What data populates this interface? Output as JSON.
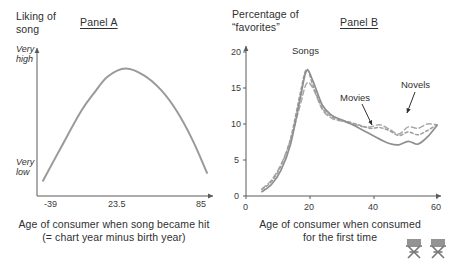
{
  "figure": {
    "background": "#ffffff",
    "curve_color": "#9a9a9a",
    "axis_color": "#5a5a5a",
    "text_color": "#2f2f2f"
  },
  "panel_a": {
    "title": "Panel A",
    "y_axis_title": "Liking of\nsong",
    "y_axis_max_label": "Very\nhigh",
    "y_axis_min_label": "Very\nlow",
    "x_ticks": [
      "-39",
      "23.5",
      "85"
    ],
    "caption": "Age of consumer when song became hit\n(= chart year minus birth year)"
  },
  "panel_b": {
    "title": "Panel B",
    "y_axis_title": "Percentage of\n“favorites”",
    "y_ticks": [
      "0",
      "5",
      "10",
      "15",
      "20"
    ],
    "x_ticks": [
      "0",
      "20",
      "40",
      "60"
    ],
    "caption": "Age of consumer when consumed\nfor the first time",
    "series_labels": {
      "songs": "Songs",
      "movies": "Movies",
      "novels": "Novels"
    },
    "watermark_icon": "director-chair-icon"
  },
  "chart_data": [
    {
      "type": "line",
      "title": "Panel A",
      "xlabel": "Age of consumer when song became hit (= chart year minus birth year)",
      "ylabel": "Liking of song",
      "xlim": [
        -39,
        85
      ],
      "ylim": [
        0,
        1
      ],
      "grid": false,
      "legend": "none",
      "xticks": [
        -39,
        23.5,
        85
      ],
      "yticks_labels": [
        "Very low",
        "Very high"
      ],
      "series": [
        {
          "name": "Liking of song",
          "style": "solid",
          "x": [
            -39,
            -25,
            -10,
            0,
            10,
            23.5,
            37,
            50,
            62,
            74,
            85
          ],
          "y": [
            0.07,
            0.33,
            0.6,
            0.74,
            0.86,
            0.92,
            0.87,
            0.76,
            0.6,
            0.38,
            0.13
          ]
        }
      ]
    },
    {
      "type": "line",
      "title": "Panel B",
      "xlabel": "Age of consumer when consumed for the first time",
      "ylabel": "Percentage of “favorites”",
      "xlim": [
        0,
        60
      ],
      "ylim": [
        0,
        20
      ],
      "grid": false,
      "legend": "annotations",
      "xticks": [
        0,
        20,
        40,
        60
      ],
      "yticks": [
        0,
        5,
        10,
        15,
        20
      ],
      "series": [
        {
          "name": "Songs",
          "style": "solid",
          "x": [
            5,
            8,
            11,
            14,
            17,
            19,
            21,
            24,
            27,
            30,
            33,
            36,
            39,
            42,
            45,
            48,
            51,
            54,
            57,
            60
          ],
          "y": [
            0.6,
            1.6,
            3.6,
            7.2,
            13.5,
            17.4,
            16.0,
            12.6,
            11.2,
            10.6,
            10.0,
            9.3,
            8.6,
            7.9,
            7.3,
            7.1,
            7.6,
            7.2,
            8.2,
            9.8
          ]
        },
        {
          "name": "Movies",
          "style": "dashed",
          "x": [
            5,
            8,
            11,
            14,
            17,
            19,
            21,
            24,
            27,
            30,
            33,
            36,
            39,
            42,
            45,
            48,
            51,
            54,
            57,
            60
          ],
          "y": [
            0.9,
            2.0,
            4.2,
            8.0,
            14.2,
            17.6,
            15.4,
            12.2,
            11.0,
            10.5,
            10.2,
            9.8,
            9.4,
            9.5,
            9.1,
            8.4,
            8.9,
            8.5,
            9.1,
            9.9
          ]
        },
        {
          "name": "Novels",
          "style": "dashed",
          "x": [
            5,
            8,
            11,
            14,
            17,
            19,
            21,
            24,
            27,
            30,
            33,
            36,
            39,
            42,
            45,
            48,
            51,
            54,
            57,
            60
          ],
          "y": [
            1.0,
            2.2,
            4.4,
            7.8,
            12.6,
            15.6,
            15.0,
            12.0,
            10.8,
            10.4,
            10.1,
            9.7,
            9.6,
            9.9,
            9.3,
            8.6,
            9.6,
            9.4,
            10.0,
            9.9
          ]
        }
      ]
    }
  ]
}
